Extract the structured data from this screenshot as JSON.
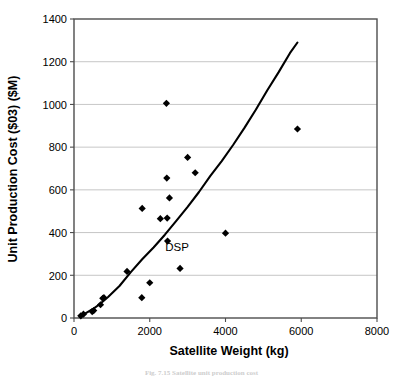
{
  "figure": {
    "caption": "Fig. 7.15   Satellite unit production cost"
  },
  "chart_data": {
    "type": "scatter",
    "title": "",
    "xlabel": "Satellite Weight (kg)",
    "ylabel": "Unit Production Cost ($03) ($M)",
    "xlim": [
      0,
      8000
    ],
    "ylim": [
      0,
      1400
    ],
    "xticks": [
      0,
      2000,
      4000,
      6000,
      8000
    ],
    "yticks": [
      0,
      200,
      400,
      600,
      800,
      1000,
      1200,
      1400
    ],
    "xticklabels": [
      "0",
      "2000",
      "4000",
      "6000",
      "8000"
    ],
    "yticklabels": [
      "0",
      "200",
      "400",
      "600",
      "800",
      "1000",
      "1200",
      "1400"
    ],
    "grid": "horizontal",
    "legend": "none",
    "marker": "diamond",
    "marker_color": "#000000",
    "line_color": "#000000",
    "points": [
      {
        "x": 180,
        "y": 10
      },
      {
        "x": 250,
        "y": 18
      },
      {
        "x": 480,
        "y": 30
      },
      {
        "x": 520,
        "y": 35
      },
      {
        "x": 700,
        "y": 62
      },
      {
        "x": 760,
        "y": 92
      },
      {
        "x": 790,
        "y": 95
      },
      {
        "x": 1400,
        "y": 218
      },
      {
        "x": 1790,
        "y": 95
      },
      {
        "x": 1800,
        "y": 513
      },
      {
        "x": 2000,
        "y": 165
      },
      {
        "x": 2280,
        "y": 465
      },
      {
        "x": 2440,
        "y": 1005
      },
      {
        "x": 2450,
        "y": 655
      },
      {
        "x": 2460,
        "y": 468
      },
      {
        "x": 2470,
        "y": 360
      },
      {
        "x": 2520,
        "y": 562
      },
      {
        "x": 2800,
        "y": 232
      },
      {
        "x": 3000,
        "y": 752
      },
      {
        "x": 3200,
        "y": 680
      },
      {
        "x": 4000,
        "y": 397
      },
      {
        "x": 5900,
        "y": 885
      }
    ],
    "trendline": [
      {
        "x": 150,
        "y": 5
      },
      {
        "x": 300,
        "y": 22
      },
      {
        "x": 500,
        "y": 42
      },
      {
        "x": 700,
        "y": 68
      },
      {
        "x": 900,
        "y": 98
      },
      {
        "x": 1200,
        "y": 150
      },
      {
        "x": 1500,
        "y": 215
      },
      {
        "x": 1800,
        "y": 275
      },
      {
        "x": 2100,
        "y": 330
      },
      {
        "x": 2400,
        "y": 390
      },
      {
        "x": 2700,
        "y": 455
      },
      {
        "x": 3000,
        "y": 520
      },
      {
        "x": 3300,
        "y": 590
      },
      {
        "x": 3600,
        "y": 665
      },
      {
        "x": 3900,
        "y": 735
      },
      {
        "x": 4200,
        "y": 810
      },
      {
        "x": 4500,
        "y": 890
      },
      {
        "x": 4800,
        "y": 975
      },
      {
        "x": 5100,
        "y": 1065
      },
      {
        "x": 5400,
        "y": 1150
      },
      {
        "x": 5700,
        "y": 1240
      },
      {
        "x": 5900,
        "y": 1290
      }
    ],
    "annotations": [
      {
        "label": "DSP",
        "x": 2720,
        "y": 312
      }
    ]
  }
}
